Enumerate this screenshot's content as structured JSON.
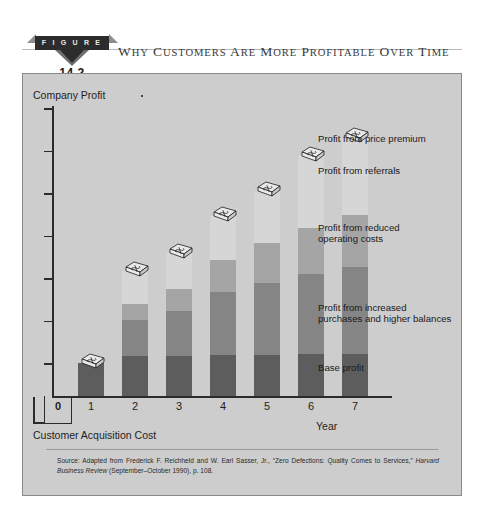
{
  "figure": {
    "badge_label": "F I G U R E",
    "number": "14.2",
    "title": "Why Customers Are More Profitable over Time"
  },
  "chart_data": {
    "type": "bar",
    "subtype": "stacked",
    "title": "Why Customers Are More Profitable over Time",
    "ylabel": "Company Profit",
    "xlabel": "Year",
    "categories": [
      "0",
      "1",
      "2",
      "3",
      "4",
      "5",
      "6",
      "7"
    ],
    "grid": false,
    "legend_position": "right-annotations",
    "y_axis": {
      "ticks_count": 7,
      "tick_labels": [],
      "range_note": "unlabeled relative scale"
    },
    "series": [
      {
        "name": "Base profit",
        "color": "#5d5d5d",
        "values": [
          0,
          33,
          40,
          40,
          41,
          41,
          42,
          42
        ]
      },
      {
        "name": "Profit from increased purchases and higher balances",
        "color": "#858585",
        "values": [
          0,
          0,
          36,
          45,
          63,
          72,
          80,
          87
        ]
      },
      {
        "name": "Profit from reduced operating costs",
        "color": "#a5a5a5",
        "values": [
          0,
          0,
          16,
          22,
          32,
          40,
          46,
          52
        ]
      },
      {
        "name": "Profit from referrals",
        "color": "#d6d6d6",
        "values": [
          0,
          0,
          33,
          36,
          44,
          52,
          72,
          78
        ]
      },
      {
        "name": "Profit from price premium",
        "color": "#efefef",
        "values": [
          0,
          0,
          0,
          0,
          0,
          0,
          0,
          0
        ]
      }
    ],
    "below_axis": {
      "label": "Customer Acquisition Cost",
      "category": "0"
    },
    "annotations": [
      "Profit from price premium",
      "Profit from referrals",
      "Profit from reduced operating costs",
      "Profit from increased purchases and higher balances",
      "Base profit"
    ],
    "markers": "money-icon on top of each bar"
  },
  "labels": {
    "price_premium": "Profit from price premium",
    "referrals": "Profit from referrals",
    "reduced_costs_l1": "Profit from reduced",
    "reduced_costs_l2": "operating costs",
    "increased_purchases_l1": "Profit from increased",
    "increased_purchases_l2": "purchases and higher balances",
    "base_profit": "Base profit",
    "company_profit": "Company Profit",
    "year": "Year",
    "acquisition_cost": "Customer Acquisition Cost"
  },
  "source": {
    "text_1": "Source: Adapted from Frederick F. Reichheld and W. Earl Sasser, Jr., “Zero Defections: Quality Comes to Services,” ",
    "italic": "Harvard Business Review",
    "text_2": " (September–October 1990), p. 108."
  },
  "colors": {
    "panel_bg": "#cdcdcd",
    "base_profit": "#5d5d5d",
    "increased_purchases": "#858585",
    "reduced_costs": "#a5a5a5",
    "referrals": "#d6d6d6",
    "price_premium": "#efefef",
    "axis": "#2b2b2b"
  }
}
